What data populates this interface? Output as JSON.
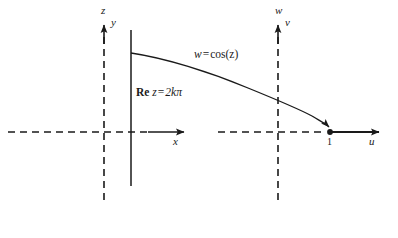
{
  "figure": {
    "type": "complex-mapping-diagram",
    "stroke_color": "#1a1a1a",
    "background_color": "#ffffff"
  },
  "z_plane": {
    "vertical_axis_top_label": "z",
    "vertical_axis_label": "y",
    "horizontal_axis_label": "x",
    "line_label_prefix": "Re",
    "line_label_variable": "z",
    "line_label_equals": "=",
    "line_label_value": "2kπ",
    "line_label_full": "Re z = 2kπ"
  },
  "w_plane": {
    "vertical_axis_top_label": "w",
    "vertical_axis_label": "v",
    "horizontal_axis_label": "u",
    "point_label": "1"
  },
  "mapping": {
    "curve_label_lhs": "w",
    "curve_label_equals": "=",
    "curve_label_rhs": "cos(z)",
    "curve_label_full": "w = cos(z)"
  }
}
